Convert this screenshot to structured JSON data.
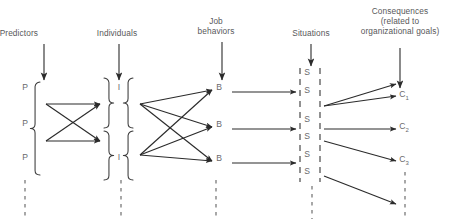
{
  "diagram": {
    "colors": {
      "text": "#58585a",
      "node_text": "#6a6a6c",
      "line": "#2b2b2b",
      "dashed": "#6e6e6e"
    },
    "headings": [
      {
        "id": "predictors",
        "lines": [
          "Predictors"
        ],
        "x": 38,
        "y": 28,
        "align": "left"
      },
      {
        "id": "individuals",
        "lines": [
          "Individuals"
        ],
        "x": 117,
        "y": 28,
        "align": "center"
      },
      {
        "id": "job-behaviors",
        "lines": [
          "Job",
          "behaviors"
        ],
        "x": 216,
        "y": 16,
        "align": "center"
      },
      {
        "id": "situations",
        "lines": [
          "Situations"
        ],
        "x": 311,
        "y": 28,
        "align": "center"
      },
      {
        "id": "consequences",
        "lines": [
          "Consequences",
          "(related to",
          "organizational goals)"
        ],
        "x": 400,
        "y": 6,
        "align": "center"
      }
    ],
    "nodes": {
      "predictors": [
        {
          "label": "P",
          "x": 25,
          "y": 92
        },
        {
          "label": "P",
          "x": 25,
          "y": 128
        },
        {
          "label": "P",
          "x": 25,
          "y": 162
        }
      ],
      "individuals": [
        {
          "label": "I",
          "x": 119,
          "y": 92
        },
        {
          "label": "I",
          "x": 119,
          "y": 162
        }
      ],
      "behaviors": [
        {
          "label": "B",
          "x": 219,
          "y": 92
        },
        {
          "label": "B",
          "x": 219,
          "y": 129
        },
        {
          "label": "B",
          "x": 219,
          "y": 163
        }
      ],
      "situations": [
        {
          "label": "S",
          "x": 307,
          "y": 77
        },
        {
          "label": "S",
          "x": 307,
          "y": 95
        },
        {
          "label": "S",
          "x": 307,
          "y": 124
        },
        {
          "label": "S",
          "x": 307,
          "y": 141
        },
        {
          "label": "S",
          "x": 307,
          "y": 159
        },
        {
          "label": "S",
          "x": 307,
          "y": 176
        }
      ],
      "consequences": [
        {
          "label": "C",
          "sub": "1",
          "x": 404,
          "y": 99
        },
        {
          "label": "C",
          "sub": "2",
          "x": 404,
          "y": 131
        },
        {
          "label": "C",
          "sub": "3",
          "x": 404,
          "y": 164
        }
      ]
    },
    "heading_arrows": [
      {
        "id": "predictors-arrow",
        "x": 44,
        "y1": 44,
        "y2": 80
      },
      {
        "id": "individuals-arrow",
        "x": 119,
        "y1": 44,
        "y2": 80
      },
      {
        "id": "job-behaviors-arrow",
        "x": 222,
        "y1": 42,
        "y2": 80
      },
      {
        "id": "situations-arrow",
        "x": 311,
        "y1": 44,
        "y2": 66
      },
      {
        "id": "consequences-arrow",
        "x": 400,
        "y1": 48,
        "y2": 88
      }
    ],
    "column_dashed_lines": [
      {
        "id": "predictors-dashed",
        "x": 25,
        "y1": 180,
        "y2": 219
      },
      {
        "id": "individuals-dashed",
        "x": 121,
        "y1": 180,
        "y2": 219
      },
      {
        "id": "behaviors-dashed",
        "x": 216,
        "y1": 180,
        "y2": 219
      },
      {
        "id": "situations-dashed",
        "x": 312,
        "y1": 186,
        "y2": 219
      },
      {
        "id": "consequences-dashed",
        "x": 405,
        "y1": 172,
        "y2": 219
      }
    ],
    "braces": {
      "predictors": {
        "x": 40,
        "top": 82,
        "bottom": 175
      },
      "individuals_left_top": {
        "x": 104,
        "top": 78,
        "bottom": 128
      },
      "individuals_right_top": {
        "x": 133,
        "top": 78,
        "bottom": 128
      },
      "individuals_left_bottom": {
        "x": 104,
        "top": 131,
        "bottom": 180
      },
      "individuals_right_bottom": {
        "x": 133,
        "top": 131,
        "bottom": 180
      }
    },
    "situation_dashed_columns": [
      {
        "id": "situations-left",
        "x": 300,
        "y1": 68,
        "y2": 182
      },
      {
        "id": "situations-right",
        "x": 320,
        "y1": 68,
        "y2": 182
      }
    ],
    "edges_predictor_to_individual": [
      {
        "from": [
          46,
          104
        ],
        "to": [
          100,
          104
        ]
      },
      {
        "from": [
          46,
          104
        ],
        "to": [
          100,
          141
        ]
      },
      {
        "from": [
          46,
          141
        ],
        "to": [
          100,
          104
        ]
      },
      {
        "from": [
          46,
          141
        ],
        "to": [
          100,
          141
        ]
      }
    ],
    "edges_individual_to_behavior": [
      {
        "from": [
          140,
          104
        ],
        "to": [
          212,
          90
        ]
      },
      {
        "from": [
          140,
          104
        ],
        "to": [
          212,
          127
        ]
      },
      {
        "from": [
          140,
          104
        ],
        "to": [
          212,
          161
        ]
      },
      {
        "from": [
          140,
          155
        ],
        "to": [
          212,
          90
        ]
      },
      {
        "from": [
          140,
          155
        ],
        "to": [
          212,
          127
        ]
      },
      {
        "from": [
          140,
          155
        ],
        "to": [
          212,
          161
        ]
      }
    ],
    "edges_behavior_to_situation": [
      {
        "from": [
          232,
          92
        ],
        "to": [
          296,
          92
        ]
      },
      {
        "from": [
          232,
          129
        ],
        "to": [
          296,
          129
        ]
      },
      {
        "from": [
          232,
          163
        ],
        "to": [
          296,
          163
        ]
      }
    ],
    "edges_situation_to_consequence": [
      {
        "from": [
          324,
          106
        ],
        "to": [
          396,
          84
        ]
      },
      {
        "from": [
          324,
          106
        ],
        "to": [
          396,
          96
        ]
      },
      {
        "from": [
          324,
          129
        ],
        "to": [
          396,
          129
        ]
      },
      {
        "from": [
          324,
          141
        ],
        "to": [
          396,
          161
        ]
      },
      {
        "from": [
          324,
          176
        ],
        "to": [
          396,
          204
        ]
      }
    ]
  }
}
